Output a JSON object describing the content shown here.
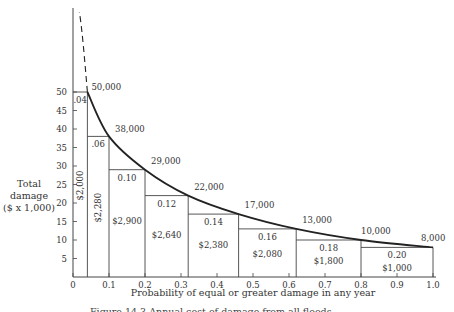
{
  "chart_data": {
    "type": "line",
    "title": "",
    "xlabel": "Probability of equal or greater damage in any year",
    "ylabel": "Total damage ($ x 1,000)",
    "ylabel_lines": [
      "Total",
      "damage",
      "($ x 1,000)"
    ],
    "xlim": [
      0,
      1.0
    ],
    "ylim": [
      0,
      50
    ],
    "x_ticks": [
      "0",
      "0.1",
      "0.2",
      "0.3",
      "0.4",
      "0.5",
      "0.6",
      "0.7",
      "0.8",
      "0.9",
      "1.0"
    ],
    "y_ticks": [
      "5",
      "10",
      "15",
      "20",
      "25",
      "30",
      "35",
      "40",
      "45",
      "50"
    ],
    "grid": false,
    "curve": {
      "name": "Damage-frequency curve",
      "x": [
        0.04,
        0.1,
        0.2,
        0.32,
        0.46,
        0.62,
        0.8,
        1.0
      ],
      "y": [
        50,
        38,
        29,
        22,
        17,
        13,
        10,
        8
      ],
      "extrapolated_dashed_to_top": true
    },
    "point_labels": [
      "50,000",
      "38,000",
      "29,000",
      "22,000",
      "17,000",
      "13,000",
      "10,000",
      "8,000"
    ],
    "bars": [
      {
        "x0": 0.0,
        "x1": 0.04,
        "height": 50,
        "width_label": ".04",
        "area_label": "$2,000",
        "area_vertical": true
      },
      {
        "x0": 0.04,
        "x1": 0.1,
        "height": 38,
        "width_label": ".06",
        "area_label": "$2,280",
        "area_vertical": true
      },
      {
        "x0": 0.1,
        "x1": 0.2,
        "height": 29,
        "width_label": "0.10",
        "area_label": "$2,900",
        "area_vertical": false
      },
      {
        "x0": 0.2,
        "x1": 0.32,
        "height": 22,
        "width_label": "0.12",
        "area_label": "$2,640",
        "area_vertical": false
      },
      {
        "x0": 0.32,
        "x1": 0.46,
        "height": 17,
        "width_label": "0.14",
        "area_label": "$2,380",
        "area_vertical": false
      },
      {
        "x0": 0.46,
        "x1": 0.62,
        "height": 13,
        "width_label": "0.16",
        "area_label": "$2,080",
        "area_vertical": false
      },
      {
        "x0": 0.62,
        "x1": 0.8,
        "height": 10,
        "width_label": "0.18",
        "area_label": "$1,800",
        "area_vertical": false
      },
      {
        "x0": 0.8,
        "x1": 1.0,
        "height": 8,
        "width_label": "0.20",
        "area_label": "$1,000",
        "area_vertical": false
      }
    ],
    "colors": {
      "line": "#222222",
      "axis": "#444444",
      "text": "#333333"
    }
  },
  "caption": "Figure 14.3  Annual cost of damage from all floods."
}
